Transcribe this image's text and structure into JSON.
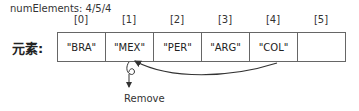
{
  "header": {
    "num_elements_label": "numElements: 4/5/4"
  },
  "array": {
    "label": "元素:",
    "indices": [
      "[0]",
      "[1]",
      "[2]",
      "[3]",
      "[4]",
      "[5]"
    ],
    "cells": [
      "\"BRA\"",
      "\"MEX\"",
      "\"PER\"",
      "\"ARG\"",
      "\"COL\"",
      ""
    ]
  },
  "annotations": {
    "remove_label": "Remove",
    "shift_arrow": {
      "from_index": 4,
      "to_index": 1
    }
  }
}
